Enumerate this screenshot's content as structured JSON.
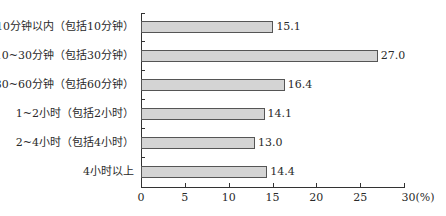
{
  "chart_data": {
    "type": "bar",
    "orientation": "horizontal",
    "title": "",
    "xlabel": "(%)",
    "ylabel": "",
    "categories": [
      "10分钟以内（包括10分钟）",
      "10~30分钟（包括30分钟）",
      "30~60分钟（包括60分钟）",
      "1~2小时（包括2小时）",
      "2~4小时（包括4小时）",
      "4小时以上"
    ],
    "values": [
      15.1,
      27.0,
      16.4,
      14.1,
      13.0,
      14.4
    ],
    "value_labels": [
      "15.1",
      "27.0",
      "16.4",
      "14.1",
      "13.0",
      "14.4"
    ],
    "xlim": [
      0,
      30
    ],
    "xticks": [
      "0",
      "5",
      "10",
      "15",
      "20",
      "25",
      "30(%)"
    ],
    "grid": false,
    "legend": null,
    "bar_color": "#d4d4d4",
    "bar_edge_color": "#555555"
  }
}
